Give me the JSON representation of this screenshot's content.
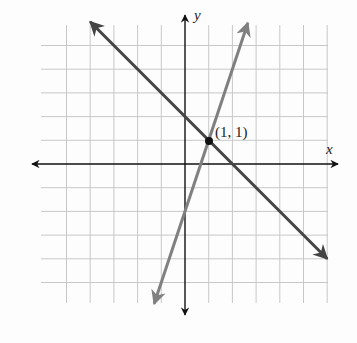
{
  "chart_data": {
    "type": "line",
    "title": "",
    "xlabel": "x",
    "ylabel": "y",
    "xlim": [
      -6,
      6
    ],
    "ylim": [
      -6,
      6
    ],
    "grid": true,
    "tick_labels": false,
    "series": [
      {
        "name": "line-1",
        "equation": "y = -x + 2",
        "slope": -1,
        "intercept": 2,
        "color": "#444444",
        "x": [
          -4,
          6
        ],
        "y": [
          6,
          -4
        ]
      },
      {
        "name": "line-2",
        "equation": "y = 3x - 2",
        "slope": 3,
        "intercept": -2,
        "color": "#808080",
        "x": [
          -1.3,
          2.65
        ],
        "y": [
          -5.9,
          5.95
        ]
      }
    ],
    "annotations": [
      {
        "text": "(1, 1)",
        "x": 1,
        "y": 1,
        "type": "intersection-point"
      }
    ]
  },
  "labels": {
    "x_axis": "x",
    "y_axis": "y",
    "point": "(1, 1)"
  }
}
